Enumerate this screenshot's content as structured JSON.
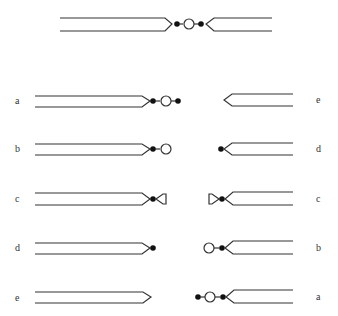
{
  "figure": {
    "top_chromosome": {
      "parts": [
        "left-arm",
        "centromere-dot",
        "circle",
        "centromere-dot",
        "right-arm"
      ]
    },
    "left_column": {
      "labels": [
        "a",
        "b",
        "c",
        "d",
        "e"
      ],
      "terminals": [
        "dot-circle-dot",
        "dot-circle",
        "dot-half",
        "dot",
        "none"
      ]
    },
    "right_column": {
      "labels": [
        "e",
        "d",
        "c",
        "b",
        "a"
      ],
      "terminals": [
        "none",
        "dot",
        "half-dot",
        "circle-dot",
        "dot-circle-dot"
      ]
    },
    "colors": {
      "stroke": "#333333",
      "fill": "#111111",
      "background": "#ffffff"
    }
  }
}
